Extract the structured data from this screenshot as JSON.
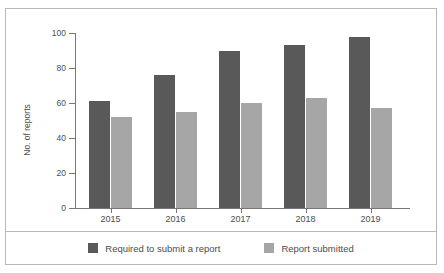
{
  "chart_data": {
    "type": "bar",
    "title": "",
    "subtitle": "",
    "xlabel": "",
    "ylabel": "No. of reports",
    "categories": [
      "2015",
      "2016",
      "2017",
      "2018",
      "2019"
    ],
    "series": [
      {
        "name": "Required to submit a report",
        "color": "#595959",
        "values": [
          61,
          76,
          90,
          93,
          98
        ]
      },
      {
        "name": "Report submitted",
        "color": "#a6a6a6",
        "values": [
          52,
          55,
          60,
          63,
          57
        ]
      }
    ],
    "ylim": [
      0,
      100
    ],
    "yticks": [
      0,
      20,
      40,
      60,
      80,
      100
    ],
    "ytick_labels": [
      "0",
      "20",
      "40",
      "60",
      "80",
      "100"
    ],
    "grid": false,
    "legend_position": "bottom"
  },
  "colors": {
    "series_dark": "#595959",
    "series_light": "#a6a6a6",
    "axis": "#777777",
    "border": "#b9b9b9",
    "text": "#4d4d4d",
    "background": "#ffffff"
  }
}
